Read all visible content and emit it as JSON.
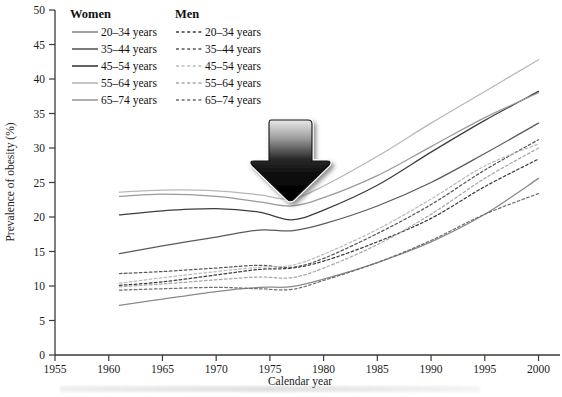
{
  "chart_data": {
    "type": "line",
    "title": "",
    "xlabel": "Calendar year",
    "ylabel": "Prevalence of obesity (%)",
    "xlim": [
      1955,
      2002
    ],
    "ylim": [
      0,
      50
    ],
    "xticks": [
      1955,
      1960,
      1965,
      1970,
      1975,
      1980,
      1985,
      1990,
      1995,
      2000
    ],
    "yticks": [
      0,
      5,
      10,
      15,
      20,
      25,
      30,
      35,
      40,
      45,
      50
    ],
    "grid": false,
    "legend_position": "top-left",
    "legend_groups": [
      {
        "title": "Women",
        "style": "solid"
      },
      {
        "title": "Men",
        "style": "dashed"
      }
    ],
    "annotations": [
      {
        "name": "down-arrow",
        "type": "arrow",
        "direction": "down",
        "x": 1977,
        "y_top": 39,
        "y_bottom": 27
      }
    ],
    "series": [
      {
        "name": "20-34 years",
        "group": "Women",
        "style": "solid",
        "color": "#8a8a8a",
        "x": [
          1961,
          1965,
          1970,
          1974,
          1977,
          1980,
          1985,
          1990,
          1995,
          2000
        ],
        "values": [
          7.2,
          8.1,
          9.2,
          9.8,
          9.9,
          11.0,
          13.4,
          16.4,
          20.4,
          25.6
        ]
      },
      {
        "name": "35-44 years",
        "group": "Women",
        "style": "solid",
        "color": "#5a5a5a",
        "x": [
          1961,
          1965,
          1970,
          1974,
          1977,
          1980,
          1985,
          1990,
          1995,
          2000
        ],
        "values": [
          14.7,
          15.8,
          17.1,
          18.1,
          18.0,
          19.0,
          21.6,
          25.0,
          29.2,
          33.6
        ]
      },
      {
        "name": "45-54 years",
        "group": "Women",
        "style": "solid",
        "color": "#3d3d3d",
        "x": [
          1961,
          1965,
          1970,
          1974,
          1977,
          1980,
          1985,
          1990,
          1995,
          2000
        ],
        "values": [
          20.3,
          20.9,
          21.2,
          20.7,
          19.6,
          21.0,
          24.6,
          29.4,
          34.0,
          38.2
        ]
      },
      {
        "name": "55-64 years",
        "group": "Women",
        "style": "solid",
        "color": "#b7b7b7",
        "x": [
          1961,
          1965,
          1970,
          1974,
          1977,
          1980,
          1985,
          1990,
          1995,
          2000
        ],
        "values": [
          23.6,
          23.9,
          23.8,
          23.2,
          22.6,
          24.5,
          28.8,
          33.6,
          38.2,
          42.8
        ]
      },
      {
        "name": "65-74 years",
        "group": "Women",
        "style": "solid",
        "color": "#9a9a9a",
        "x": [
          1961,
          1965,
          1970,
          1974,
          1977,
          1980,
          1985,
          1990,
          1995,
          2000
        ],
        "values": [
          23.0,
          23.3,
          23.0,
          22.2,
          21.6,
          22.8,
          26.0,
          30.2,
          34.4,
          38.0
        ]
      },
      {
        "name": "20-34 years",
        "group": "Men",
        "style": "dashed",
        "color": "#3d3d3d",
        "x": [
          1961,
          1965,
          1970,
          1974,
          1977,
          1980,
          1985,
          1990,
          1995,
          2000
        ],
        "values": [
          10.1,
          10.6,
          11.6,
          12.4,
          12.6,
          13.6,
          16.4,
          19.8,
          24.4,
          28.4
        ]
      },
      {
        "name": "35-44 years",
        "group": "Men",
        "style": "dashed",
        "color": "#5a5a5a",
        "x": [
          1961,
          1965,
          1970,
          1974,
          1977,
          1980,
          1985,
          1990,
          1995,
          2000
        ],
        "values": [
          11.8,
          12.1,
          12.6,
          13.0,
          12.7,
          14.0,
          17.6,
          21.8,
          26.8,
          31.2
        ]
      },
      {
        "name": "45-54 years",
        "group": "Men",
        "style": "dashed",
        "color": "#bcbcbc",
        "x": [
          1961,
          1965,
          1970,
          1974,
          1977,
          1980,
          1985,
          1990,
          1995,
          2000
        ],
        "values": [
          10.4,
          11.2,
          12.1,
          12.7,
          13.0,
          14.6,
          18.2,
          22.6,
          27.4,
          30.6
        ]
      },
      {
        "name": "55-64 years",
        "group": "Men",
        "style": "dashed",
        "color": "#a8a8a8",
        "x": [
          1961,
          1965,
          1970,
          1974,
          1977,
          1980,
          1985,
          1990,
          1995,
          2000
        ],
        "values": [
          9.9,
          10.3,
          10.9,
          11.3,
          11.2,
          12.6,
          16.0,
          20.4,
          25.6,
          30.0
        ]
      },
      {
        "name": "65-74 years",
        "group": "Men",
        "style": "dashed",
        "color": "#6e6e6e",
        "x": [
          1961,
          1965,
          1970,
          1974,
          1977,
          1980,
          1985,
          1990,
          1995,
          2000
        ],
        "values": [
          9.4,
          9.6,
          9.8,
          9.6,
          9.5,
          10.8,
          13.4,
          16.6,
          20.4,
          23.4
        ]
      }
    ]
  },
  "axis": {
    "y_title": "Prevalence of obesity (%)",
    "x_title": "Calendar year"
  },
  "legend": {
    "women_header": "Women",
    "men_header": "Men",
    "rows": [
      {
        "women": "20–34 years",
        "men": "20–34 years"
      },
      {
        "women": "35–44 years",
        "men": "35–44 years"
      },
      {
        "women": "45–54 years",
        "men": "45–54 years"
      },
      {
        "women": "55–64 years",
        "men": "55–64 years"
      },
      {
        "women": "65–74 years",
        "men": "65–74 years"
      }
    ]
  },
  "colors": {
    "axis": "#3a3a3a",
    "text": "#1b1b1b",
    "arrow_dark": "#050505",
    "arrow_light": "#d8d8d8"
  }
}
